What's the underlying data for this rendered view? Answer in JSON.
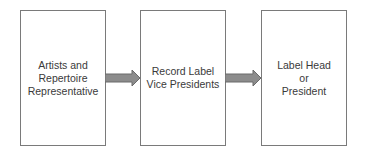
{
  "diagram": {
    "type": "flowchart",
    "direction": "left-to-right",
    "nodes": [
      {
        "id": "ar",
        "label": "Artists and\nRepertoire\nRepresentative"
      },
      {
        "id": "vp",
        "label": "Record Label\nVice Presidents"
      },
      {
        "id": "head",
        "label": "Label Head\nor\nPresident"
      }
    ],
    "edges": [
      {
        "from": "ar",
        "to": "vp"
      },
      {
        "from": "vp",
        "to": "head"
      }
    ],
    "colors": {
      "border": "#7a7a7a",
      "arrow_fill": "#8c8c8c",
      "arrow_stroke": "#6a6a6a",
      "text": "#3a3a3a"
    }
  }
}
